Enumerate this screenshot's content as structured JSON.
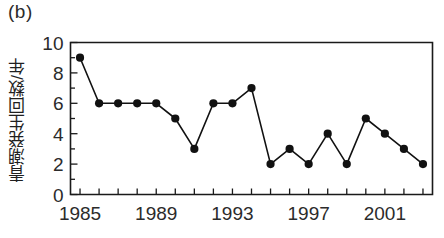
{
  "figure": {
    "panel_label": "(b)"
  },
  "chart_data": {
    "type": "line",
    "title": "",
    "subtitle": "",
    "xlabel": "",
    "ylabel": "青潮発生回数/年",
    "x": [
      1985,
      1986,
      1987,
      1988,
      1989,
      1990,
      1991,
      1992,
      1993,
      1994,
      1995,
      1996,
      1997,
      1998,
      1999,
      2000,
      2001,
      2002,
      2003
    ],
    "values": [
      9,
      6,
      6,
      6,
      6,
      5,
      3,
      6,
      6,
      7,
      2,
      3,
      2,
      4,
      2,
      5,
      4,
      3,
      2
    ],
    "series": [
      {
        "name": "青潮発生回数/年",
        "values": [
          9,
          6,
          6,
          6,
          6,
          5,
          3,
          6,
          6,
          7,
          2,
          3,
          2,
          4,
          2,
          5,
          4,
          3,
          2
        ]
      }
    ],
    "xlim": [
      1984.5,
      2003.5
    ],
    "ylim": [
      0,
      10
    ],
    "xticks": [
      1985,
      1986,
      1987,
      1988,
      1989,
      1990,
      1991,
      1992,
      1993,
      1994,
      1995,
      1996,
      1997,
      1998,
      1999,
      2000,
      2001,
      2002,
      2003
    ],
    "xtick_labels": [
      "1985",
      "",
      "",
      "",
      "1989",
      "",
      "",
      "",
      "1993",
      "",
      "",
      "",
      "1997",
      "",
      "",
      "",
      "2001",
      "",
      ""
    ],
    "xtick_labels_shown": [
      "1985",
      "1989",
      "1993",
      "1997",
      "2001"
    ],
    "yticks": [
      0,
      2,
      4,
      6,
      8,
      10
    ],
    "ytick_labels": [
      "0",
      "2",
      "4",
      "6",
      "8",
      "10"
    ],
    "grid": false,
    "legend": false,
    "legend_position": "none",
    "marker": "filled-circle",
    "line_color": "#111111",
    "marker_color": "#111111",
    "background_color": "#ffffff"
  }
}
